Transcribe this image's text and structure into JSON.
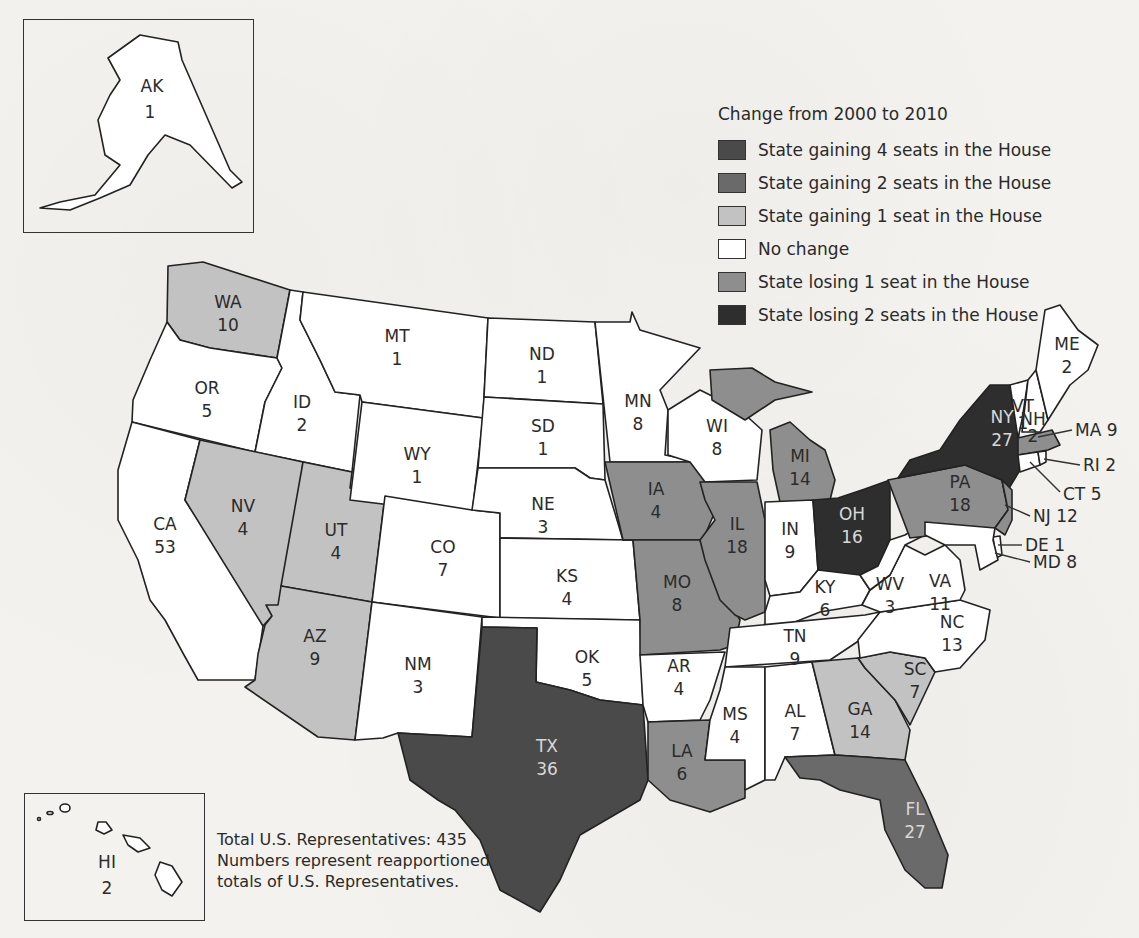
{
  "legend": {
    "title": "Change from 2000 to 2010",
    "items": [
      {
        "label": "State gaining 4 seats in the House",
        "color": "#4a4a4a",
        "change": 4
      },
      {
        "label": "State gaining 2 seats in the House",
        "color": "#6a6a6a",
        "change": 2
      },
      {
        "label": "State gaining 1 seat in the House",
        "color": "#c2c2c2",
        "change": 1
      },
      {
        "label": "No change",
        "color": "#ffffff",
        "change": 0
      },
      {
        "label": "State losing 1 seat in the House",
        "color": "#8e8e8e",
        "change": -1
      },
      {
        "label": "State losing 2 seats in the House",
        "color": "#2e2e2e",
        "change": -2
      }
    ]
  },
  "notes": {
    "line1": "Total U.S. Representatives: 435",
    "line2": "Numbers represent reapportioned",
    "line3": "totals of U.S. Representatives."
  },
  "states": {
    "AK": {
      "abbr": "AK",
      "seats": "1",
      "change": 0
    },
    "HI": {
      "abbr": "HI",
      "seats": "2",
      "change": 0
    },
    "WA": {
      "abbr": "WA",
      "seats": "10",
      "change": 1
    },
    "OR": {
      "abbr": "OR",
      "seats": "5",
      "change": 0
    },
    "CA": {
      "abbr": "CA",
      "seats": "53",
      "change": 0
    },
    "ID": {
      "abbr": "ID",
      "seats": "2",
      "change": 0
    },
    "NV": {
      "abbr": "NV",
      "seats": "4",
      "change": 1
    },
    "UT": {
      "abbr": "UT",
      "seats": "4",
      "change": 1
    },
    "AZ": {
      "abbr": "AZ",
      "seats": "9",
      "change": 1
    },
    "MT": {
      "abbr": "MT",
      "seats": "1",
      "change": 0
    },
    "WY": {
      "abbr": "WY",
      "seats": "1",
      "change": 0
    },
    "CO": {
      "abbr": "CO",
      "seats": "7",
      "change": 0
    },
    "NM": {
      "abbr": "NM",
      "seats": "3",
      "change": 0
    },
    "ND": {
      "abbr": "ND",
      "seats": "1",
      "change": 0
    },
    "SD": {
      "abbr": "SD",
      "seats": "1",
      "change": 0
    },
    "NE": {
      "abbr": "NE",
      "seats": "3",
      "change": 0
    },
    "KS": {
      "abbr": "KS",
      "seats": "4",
      "change": 0
    },
    "OK": {
      "abbr": "OK",
      "seats": "5",
      "change": 0
    },
    "TX": {
      "abbr": "TX",
      "seats": "36",
      "change": 4
    },
    "MN": {
      "abbr": "MN",
      "seats": "8",
      "change": 0
    },
    "IA": {
      "abbr": "IA",
      "seats": "4",
      "change": -1
    },
    "MO": {
      "abbr": "MO",
      "seats": "8",
      "change": -1
    },
    "AR": {
      "abbr": "AR",
      "seats": "4",
      "change": 0
    },
    "LA": {
      "abbr": "LA",
      "seats": "6",
      "change": -1
    },
    "WI": {
      "abbr": "WI",
      "seats": "8",
      "change": 0
    },
    "IL": {
      "abbr": "IL",
      "seats": "18",
      "change": -1
    },
    "MI": {
      "abbr": "MI",
      "seats": "14",
      "change": -1
    },
    "IN": {
      "abbr": "IN",
      "seats": "9",
      "change": 0
    },
    "OH": {
      "abbr": "OH",
      "seats": "16",
      "change": -2
    },
    "KY": {
      "abbr": "KY",
      "seats": "6",
      "change": 0
    },
    "TN": {
      "abbr": "TN",
      "seats": "9",
      "change": 0
    },
    "MS": {
      "abbr": "MS",
      "seats": "4",
      "change": 0
    },
    "AL": {
      "abbr": "AL",
      "seats": "7",
      "change": 0
    },
    "GA": {
      "abbr": "GA",
      "seats": "14",
      "change": 1
    },
    "FL": {
      "abbr": "FL",
      "seats": "27",
      "change": 2
    },
    "SC": {
      "abbr": "SC",
      "seats": "7",
      "change": 1
    },
    "NC": {
      "abbr": "NC",
      "seats": "13",
      "change": 0
    },
    "VA": {
      "abbr": "VA",
      "seats": "11",
      "change": 0
    },
    "WV": {
      "abbr": "WV",
      "seats": "3",
      "change": 0
    },
    "PA": {
      "abbr": "PA",
      "seats": "18",
      "change": -1
    },
    "NY": {
      "abbr": "NY",
      "seats": "27",
      "change": -2
    },
    "VT": {
      "abbr": "VT",
      "seats": "1",
      "change": 0
    },
    "NH": {
      "abbr": "NH",
      "seats": "2",
      "change": 0
    },
    "ME": {
      "abbr": "ME",
      "seats": "2",
      "change": 0
    },
    "MA": {
      "abbr": "MA",
      "seats": "9",
      "change": -1,
      "callout": "MA 9"
    },
    "RI": {
      "abbr": "RI",
      "seats": "2",
      "change": 0,
      "callout": "RI 2"
    },
    "CT": {
      "abbr": "CT",
      "seats": "5",
      "change": 0,
      "callout": "CT 5"
    },
    "NJ": {
      "abbr": "NJ",
      "seats": "12",
      "change": -1,
      "callout": "NJ 12"
    },
    "DE": {
      "abbr": "DE",
      "seats": "1",
      "change": 0,
      "callout": "DE 1"
    },
    "MD": {
      "abbr": "MD",
      "seats": "8",
      "change": 0,
      "callout": "MD 8"
    }
  }
}
